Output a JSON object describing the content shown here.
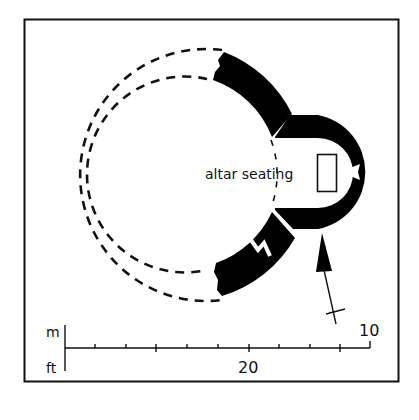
{
  "diagram": {
    "type": "archaeological site plan",
    "labels": {
      "altar": "altar seating"
    },
    "scale": {
      "metric_unit": "m",
      "imperial_unit": "ft",
      "metric_end_value": "10",
      "imperial_mid_value": "20"
    },
    "north_arrow": "north-arrow",
    "colors": {
      "wall": "#000000",
      "background": "#ffffff",
      "line": "#111111"
    }
  }
}
